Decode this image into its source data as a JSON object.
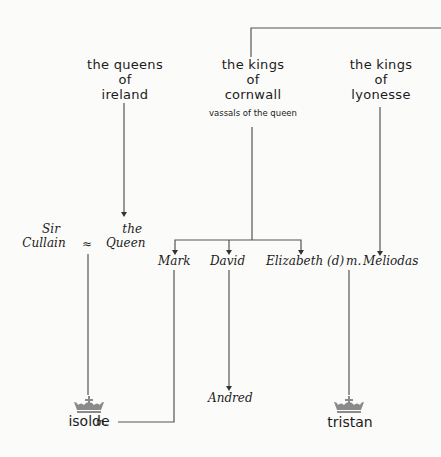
{
  "houses": [
    {
      "id": "ireland",
      "lines": [
        "the queens",
        "of",
        "ireland"
      ]
    },
    {
      "id": "cornwall",
      "lines": [
        "the kings",
        "of",
        "cornwall"
      ],
      "note": "vassals of the queen"
    },
    {
      "id": "lyonesse",
      "lines": [
        "the kings",
        "of",
        "lyonesse"
      ]
    }
  ],
  "people": {
    "sir_cullain": [
      "Sir",
      "Cullain"
    ],
    "marriage_symbol": "≈",
    "the_queen": [
      "the",
      "Queen"
    ],
    "mark": "Mark",
    "david": "David",
    "elizabeth": "Elizabeth (d)",
    "married_label": "m.",
    "meliodas": "Meliodas",
    "andred": "Andred",
    "isolde": "isolde",
    "tristan": "tristan"
  },
  "colors": {
    "line": "#555555",
    "crown": "#8a8a8a",
    "text": "#1b1b1b",
    "background": "#fbfbfa"
  }
}
